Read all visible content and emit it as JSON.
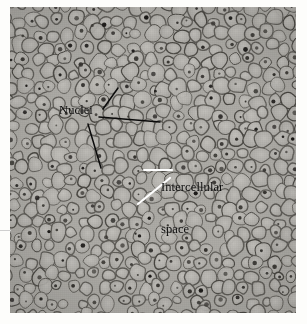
{
  "figure": {
    "type": "light-micrograph",
    "background_color": "#ffffff",
    "plate_tone": "#a9a7a2",
    "annotation_color": "#0b0b0b",
    "leader_white_color": "#ffffff"
  },
  "labels": {
    "nuclei": "Nuclei",
    "intercellular_line1": "Intercellular",
    "intercellular_line2": "space"
  },
  "leaders": {
    "nuclei": [
      {
        "name": "nuclei-leader-up",
        "x1": 103,
        "y1": 109,
        "x2": 118,
        "y2": 88,
        "color": "#0b0b0b"
      },
      {
        "name": "nuclei-leader-right",
        "x1": 99,
        "y1": 117,
        "x2": 160,
        "y2": 122,
        "color": "#0b0b0b"
      },
      {
        "name": "nuclei-leader-down",
        "x1": 88,
        "y1": 124,
        "x2": 101,
        "y2": 168,
        "color": "#0b0b0b"
      }
    ],
    "intercellular": [
      {
        "name": "intercellular-leader-horizontal",
        "x1": 144,
        "y1": 170,
        "x2": 172,
        "y2": 170,
        "color": "#ffffff"
      },
      {
        "name": "intercellular-leader-diagonal",
        "x1": 138,
        "y1": 204,
        "x2": 170,
        "y2": 178,
        "color": "#ffffff"
      }
    ]
  }
}
